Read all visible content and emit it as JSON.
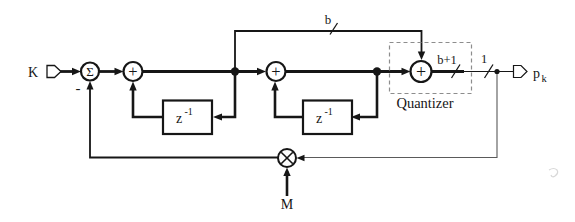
{
  "figure": {
    "kind": "signal-flow block diagram",
    "colors": {
      "background": "#ffffff",
      "line": "#161616",
      "dashed_box": "#8d8d8d",
      "feedback_line": "#5a5a5a"
    }
  },
  "labels": {
    "input_signal": "K",
    "sum_symbol": "Σ",
    "minus_sign": "-",
    "plus_sign": "+",
    "delay_base": "z",
    "delay_exponent": "-1",
    "bus_width_top": "b",
    "bus_width_quantizer_out": "b+1",
    "bus_width_output": "1",
    "quantizer_caption": "Quantizer",
    "output_base": "p",
    "output_subscript": "k",
    "modulus_input": "M"
  }
}
